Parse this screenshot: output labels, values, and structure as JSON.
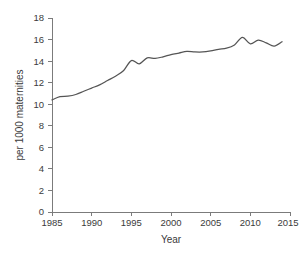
{
  "chart_data": {
    "type": "line",
    "title": "",
    "xlabel": "Year",
    "ylabel": "per 1000 maternities",
    "xlim": [
      1985,
      2015
    ],
    "ylim": [
      0,
      18
    ],
    "grid": false,
    "legend": null,
    "x_ticks": [
      1985,
      1990,
      1995,
      2000,
      2005,
      2010,
      2015
    ],
    "y_ticks": [
      0,
      2,
      4,
      6,
      8,
      10,
      12,
      14,
      16,
      18
    ],
    "line_color": "#555555",
    "axis_color": "#7b7b7b",
    "series": [
      {
        "name": "Rate per 1000 maternities",
        "x": [
          1985,
          1986,
          1987,
          1988,
          1989,
          1990,
          1991,
          1992,
          1993,
          1994,
          1995,
          1996,
          1997,
          1998,
          1999,
          2000,
          2001,
          2002,
          2003,
          2004,
          2005,
          2006,
          2007,
          2008,
          2009,
          2010,
          2011,
          2012,
          2013,
          2014
        ],
        "values": [
          10.4,
          10.7,
          10.75,
          10.9,
          11.2,
          11.5,
          11.8,
          12.2,
          12.6,
          13.1,
          14.05,
          13.75,
          14.3,
          14.25,
          14.4,
          14.6,
          14.75,
          14.9,
          14.85,
          14.85,
          14.95,
          15.1,
          15.2,
          15.5,
          16.2,
          15.6,
          15.95,
          15.7,
          15.4,
          15.8
        ]
      }
    ]
  },
  "caption": {
    "text": ""
  }
}
